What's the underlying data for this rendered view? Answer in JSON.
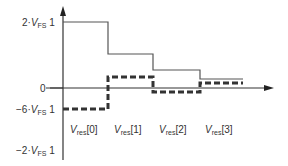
{
  "diagram": {
    "y_labels": {
      "top": {
        "prefix": "2·",
        "v": "V",
        "sub": "FS",
        "suffix": " 1"
      },
      "zero": "0",
      "neg6": {
        "prefix": "−6·",
        "v": "V",
        "sub": "FS",
        "suffix": " 1"
      },
      "neg2": {
        "prefix": "−2·",
        "v": "V",
        "sub": "FS",
        "suffix": " 1"
      }
    },
    "x_labels": [
      {
        "v": "V",
        "sub": "res",
        "idx": "[0]"
      },
      {
        "v": "V",
        "sub": "res",
        "idx": "[1]"
      },
      {
        "v": "V",
        "sub": "res",
        "idx": "[2]"
      },
      {
        "v": "V",
        "sub": "res",
        "idx": "[3]"
      }
    ],
    "series": [
      {
        "name": "solid-staircase",
        "style": "solid",
        "color": "#555555",
        "points": [
          [
            63,
            22
          ],
          [
            108,
            22
          ],
          [
            108,
            54
          ],
          [
            153,
            54
          ],
          [
            153,
            70
          ],
          [
            200,
            70
          ],
          [
            200,
            79
          ],
          [
            243,
            79
          ]
        ]
      },
      {
        "name": "dashed-residue",
        "style": "dashed",
        "color": "#333333",
        "points": [
          [
            63,
            109
          ],
          [
            108,
            109
          ],
          [
            108,
            77
          ],
          [
            153,
            77
          ],
          [
            153,
            92
          ],
          [
            200,
            92
          ],
          [
            200,
            83
          ],
          [
            243,
            83
          ]
        ]
      }
    ]
  }
}
